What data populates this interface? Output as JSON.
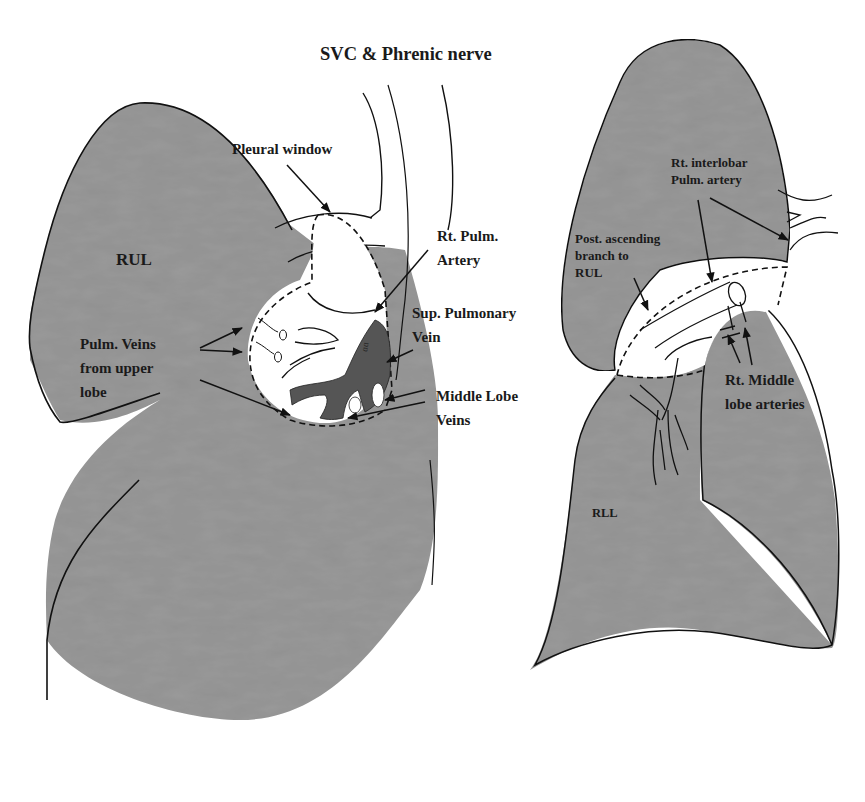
{
  "figure": {
    "type": "anatomical diagram",
    "colors": {
      "lung_fill": "#9a9a9a",
      "vein_fill": "#5a5a5a",
      "outline": "#111111",
      "window_fill": "#ffffff",
      "background": "#ffffff"
    }
  },
  "left_panel": {
    "title": "SVC & Phrenic nerve",
    "lobe_label": "RUL",
    "labels": {
      "pleural_window": "Pleural window",
      "rt_pulm_artery_1": "Rt. Pulm.",
      "rt_pulm_artery_2": "Artery",
      "sup_pulm_vein_1": "Sup. Pulmonary",
      "sup_pulm_vein_2": "Vein",
      "pulm_veins_1": "Pulm. Veins",
      "pulm_veins_2": "from upper",
      "pulm_veins_3": "lobe",
      "middle_lobe_veins_1": "Middle Lobe",
      "middle_lobe_veins_2": "Veins"
    }
  },
  "right_panel": {
    "lobe_label": "RLL",
    "labels": {
      "interlobar_1": "Rt. interlobar",
      "interlobar_2": "Pulm. artery",
      "post_ascending_1": "Post. ascending",
      "post_ascending_2": "branch to",
      "post_ascending_3": "RUL",
      "middle_lobe_arteries_1": "Rt. Middle",
      "middle_lobe_arteries_2": "lobe arteries"
    }
  }
}
